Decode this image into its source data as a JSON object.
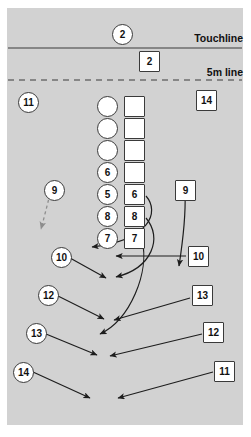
{
  "diagram": {
    "pitch_color": "#d2d2d2",
    "page_background": "#ffffff",
    "line_color": "#3a3a3a",
    "labels": {
      "touchline": "Touchline",
      "five_metre_line": "5m line"
    }
  },
  "markers": {
    "thrower_circle": {
      "label": "2",
      "shape": "circle",
      "x": 112,
      "y": 24
    },
    "thrower_square": {
      "label": "2",
      "shape": "square",
      "x": 139,
      "y": 51
    },
    "left_wing_circle": {
      "label": "11",
      "shape": "circle",
      "x": 18,
      "y": 92
    },
    "right_wing_square": {
      "label": "14",
      "shape": "square",
      "x": 196,
      "y": 90
    },
    "scrumhalf_circle": {
      "label": "9",
      "shape": "circle",
      "x": 44,
      "y": 180
    },
    "scrumhalf_square": {
      "label": "9",
      "shape": "square",
      "x": 175,
      "y": 180
    },
    "flyhalf_circle": {
      "label": "10",
      "shape": "circle",
      "x": 51,
      "y": 247
    },
    "flyhalf_square": {
      "label": "10",
      "shape": "square",
      "x": 188,
      "y": 246
    },
    "inside_centre_circle": {
      "label": "12",
      "shape": "circle",
      "x": 38,
      "y": 285
    },
    "outside_centre_square": {
      "label": "13",
      "shape": "square",
      "x": 192,
      "y": 285
    },
    "outside_centre_circle": {
      "label": "13",
      "shape": "circle",
      "x": 26,
      "y": 323
    },
    "inside_centre_square": {
      "label": "12",
      "shape": "square",
      "x": 203,
      "y": 322
    },
    "wing_circle": {
      "label": "14",
      "shape": "circle",
      "x": 13,
      "y": 362
    },
    "wing_square": {
      "label": "11",
      "shape": "square",
      "x": 214,
      "y": 361
    }
  },
  "lineout": {
    "circle_column_x": 97,
    "square_column_x": 124,
    "row_start_y": 96,
    "row_step": 22,
    "circles": [
      {
        "label": "",
        "empty": true
      },
      {
        "label": "",
        "empty": true
      },
      {
        "label": "",
        "empty": true
      },
      {
        "label": "6",
        "empty": false
      },
      {
        "label": "5",
        "empty": false
      },
      {
        "label": "8",
        "empty": false
      },
      {
        "label": "7",
        "empty": false
      }
    ],
    "squares": [
      {
        "label": "",
        "empty": true
      },
      {
        "label": "",
        "empty": true
      },
      {
        "label": "",
        "empty": true
      },
      {
        "label": "",
        "empty": true
      },
      {
        "label": "6",
        "empty": false
      },
      {
        "label": "8",
        "empty": false
      },
      {
        "label": "7",
        "empty": false
      }
    ]
  }
}
